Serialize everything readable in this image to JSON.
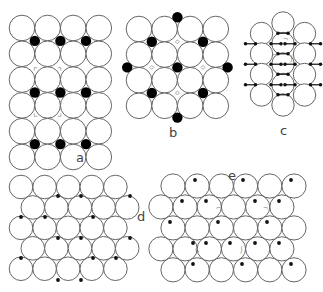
{
  "figure": {
    "panels": [
      {
        "id": "a",
        "label": "a",
        "lattice": "square-like",
        "cols": 4,
        "rows": 6,
        "adsorbate": "large black dots at bridge sites between row pairs"
      },
      {
        "id": "b",
        "label": "b",
        "lattice": "square",
        "cols": 4,
        "rows": 4,
        "adsorbate": "large black dots in centered arrangement"
      },
      {
        "id": "c",
        "label": "c",
        "lattice": "hexagonal",
        "adsorbate": "small dots paired as bonds"
      },
      {
        "id": "d",
        "label": "d",
        "lattice": "hexagonal",
        "cols": 5,
        "rows": 5,
        "adsorbate": "small dots at hollow sites"
      },
      {
        "id": "e",
        "label": "e",
        "lattice": "hexagonal",
        "cols": 6,
        "rows": 5,
        "adsorbate": "small dots at hollow sites"
      }
    ]
  },
  "labels": {
    "a": "a",
    "b": "b",
    "c": "c",
    "d": "d",
    "e": "e"
  }
}
